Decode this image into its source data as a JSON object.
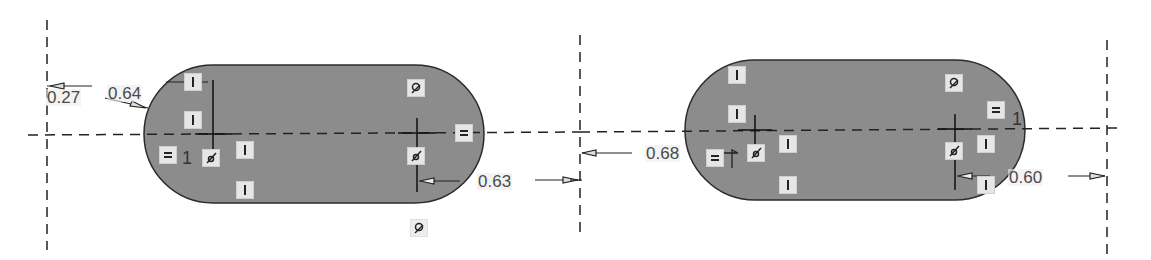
{
  "sketch": {
    "slot_fill": "#8c8c8c",
    "slot_stroke": "#2b2b2b",
    "line_color": "#222222",
    "dimensions": {
      "d1": "0.27",
      "d2": "0.64",
      "d3": "0.63",
      "d4": "0.68",
      "d5": "0.60"
    },
    "labels": {
      "left_equal_index": "1",
      "right_equal_index": "1"
    },
    "constraint_icons": [
      "parallel-icon",
      "parallel-icon",
      "parallel-icon",
      "parallel-icon",
      "equal-icon",
      "coincident-icon",
      "tangent-icon"
    ]
  }
}
